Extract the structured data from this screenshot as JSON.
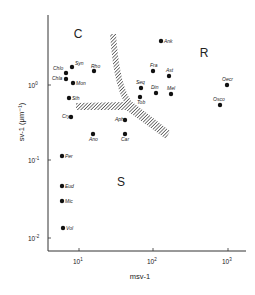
{
  "chart_data": {
    "type": "scatter",
    "title": "",
    "xlabel": "msv-1",
    "ylabel": "sv-1 (μm⁻¹)",
    "xscale": "log",
    "yscale": "log",
    "xlim": [
      4,
      1500
    ],
    "ylim": [
      0.007,
      8
    ],
    "x_ticks": [
      "10¹",
      "10²",
      "10³"
    ],
    "y_ticks": [
      "10⁰",
      "10⁻¹",
      "10⁻²"
    ],
    "grid": false,
    "regions": [
      {
        "label": "C",
        "x": 78,
        "y": 33
      },
      {
        "label": "R",
        "x": 204,
        "y": 57
      },
      {
        "label": "S",
        "x": 121,
        "y": 186
      }
    ],
    "boundary": "hatched Y-shaped band separating C, R and S regions",
    "points": [
      {
        "label": "Chlo",
        "px": 66,
        "py": 73,
        "x": 6.3,
        "y": 1.5
      },
      {
        "label": "Chla",
        "px": 66,
        "py": 79,
        "x": 6.3,
        "y": 1.25
      },
      {
        "label": "Syn",
        "px": 72,
        "py": 67,
        "x": 7.5,
        "y": 1.8
      },
      {
        "label": "Rho",
        "px": 94,
        "py": 71,
        "x": 14.5,
        "y": 1.55
      },
      {
        "label": "Mon",
        "px": 73,
        "py": 83,
        "x": 7.8,
        "y": 1.05
      },
      {
        "label": "Sth",
        "px": 69,
        "py": 98,
        "x": 7,
        "y": 0.66
      },
      {
        "label": "Cry",
        "px": 71,
        "py": 117,
        "x": 7.3,
        "y": 0.37
      },
      {
        "label": "Ano",
        "px": 93,
        "py": 134,
        "x": 14,
        "y": 0.22
      },
      {
        "label": "Aph",
        "px": 125,
        "py": 120,
        "x": 42,
        "y": 0.33
      },
      {
        "label": "Car",
        "px": 125,
        "py": 134,
        "x": 42,
        "y": 0.22
      },
      {
        "label": "Ank",
        "px": 161,
        "py": 41,
        "x": 125,
        "y": 4.0
      },
      {
        "label": "Fra",
        "px": 153,
        "py": 71,
        "x": 100,
        "y": 1.55
      },
      {
        "label": "Ast",
        "px": 169,
        "py": 76,
        "x": 162,
        "y": 1.3
      },
      {
        "label": "Seq",
        "px": 141,
        "py": 88,
        "x": 68,
        "y": 0.92
      },
      {
        "label": "Tob",
        "px": 140,
        "py": 97,
        "x": 66,
        "y": 0.68
      },
      {
        "label": "Din",
        "px": 156,
        "py": 93,
        "x": 108,
        "y": 0.78
      },
      {
        "label": "Mel",
        "px": 171,
        "py": 94,
        "x": 172,
        "y": 0.76
      },
      {
        "label": "Oecr",
        "px": 227,
        "py": 85,
        "x": 950,
        "y": 1.0
      },
      {
        "label": "Osco",
        "px": 220,
        "py": 105,
        "x": 770,
        "y": 0.55
      },
      {
        "label": "Per",
        "px": 62,
        "py": 156,
        "x": 5.8,
        "y": 0.11
      },
      {
        "label": "Eud",
        "px": 62,
        "py": 186,
        "x": 5.8,
        "y": 0.044
      },
      {
        "label": "Mic",
        "px": 62,
        "py": 201,
        "x": 5.8,
        "y": 0.028
      },
      {
        "label": "Vol",
        "px": 63,
        "py": 228,
        "x": 6,
        "y": 0.013
      }
    ]
  }
}
